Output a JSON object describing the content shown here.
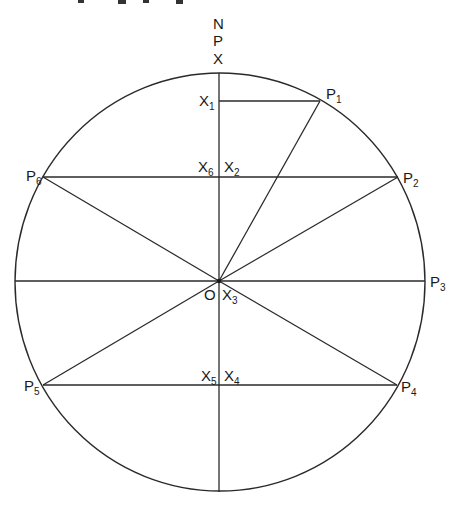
{
  "diagram": {
    "title_fragment": "",
    "north_stack": [
      "N",
      "P",
      "X"
    ],
    "center": {
      "label": "O",
      "x": 219,
      "y": 281
    },
    "circle": {
      "cx": 220,
      "cy": 282,
      "rx": 205,
      "ry": 209
    },
    "points": [
      {
        "id": "P1",
        "base": "P",
        "sub": "1",
        "x": 320,
        "y": 101
      },
      {
        "id": "P2",
        "base": "P",
        "sub": "2",
        "x": 398,
        "y": 178
      },
      {
        "id": "P3",
        "base": "P",
        "sub": "3",
        "x": 425,
        "y": 281
      },
      {
        "id": "P4",
        "base": "P",
        "sub": "4",
        "x": 397,
        "y": 385
      },
      {
        "id": "P5",
        "base": "P",
        "sub": "5",
        "x": 43,
        "y": 385
      },
      {
        "id": "P6",
        "base": "P",
        "sub": "6",
        "x": 43,
        "y": 177
      }
    ],
    "projections": [
      {
        "id": "X1",
        "base": "X",
        "sub": "1"
      },
      {
        "id": "X2",
        "base": "X",
        "sub": "2"
      },
      {
        "id": "X3",
        "base": "X",
        "sub": "3"
      },
      {
        "id": "X4",
        "base": "X",
        "sub": "4"
      },
      {
        "id": "X5",
        "base": "X",
        "sub": "5"
      },
      {
        "id": "X6",
        "base": "X",
        "sub": "6"
      }
    ],
    "axis_labels": {
      "north": "N",
      "p": "P",
      "x": "X",
      "origin": "O"
    }
  }
}
